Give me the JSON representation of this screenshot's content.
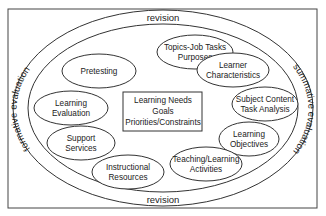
{
  "outer_ring": {
    "top_label": "revision",
    "bottom_label": "revision",
    "left_label": "formative evaluation",
    "right_label": "summative evaluation"
  },
  "center": {
    "lines": [
      "Learning Needs",
      "Goals",
      "Priorities/Constraints"
    ]
  },
  "nodes": [
    {
      "id": "topics",
      "lines": [
        "Topics-Job Tasks",
        "Purposes"
      ]
    },
    {
      "id": "learner",
      "lines": [
        "Learner",
        "Characteristics"
      ]
    },
    {
      "id": "subject",
      "lines": [
        "Subject Content",
        "Task Analysis"
      ]
    },
    {
      "id": "objectives",
      "lines": [
        "Learning",
        "Objectives"
      ]
    },
    {
      "id": "teaching",
      "lines": [
        "Teaching/Learning",
        "Activities"
      ]
    },
    {
      "id": "resources",
      "lines": [
        "Instructional",
        "Resources"
      ]
    },
    {
      "id": "support",
      "lines": [
        "Support",
        "Services"
      ]
    },
    {
      "id": "evaluation",
      "lines": [
        "Learning",
        "Evaluation"
      ]
    },
    {
      "id": "pretesting",
      "lines": [
        "Pretesting"
      ]
    }
  ],
  "colors": {
    "stroke": "#333333",
    "text": "#222222",
    "background": "#ffffff"
  }
}
